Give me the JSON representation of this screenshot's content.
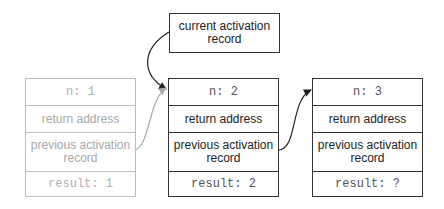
{
  "current_record": {
    "label": "current activation record"
  },
  "records": [
    {
      "n": "n: 1",
      "return_address": "return address",
      "previous": "previous activation record",
      "result": "result: 1",
      "state": "faded"
    },
    {
      "n": "n: 2",
      "return_address": "return address",
      "previous": "previous activation record",
      "result": "result: 2",
      "state": "active"
    },
    {
      "n": "n: 3",
      "return_address": "return address",
      "previous": "previous activation record",
      "result": "result: ?",
      "state": "active"
    }
  ],
  "colors": {
    "stroke": "#333333",
    "faded_stroke": "#bdbdbd",
    "faded_text": "#a8a8a8"
  }
}
